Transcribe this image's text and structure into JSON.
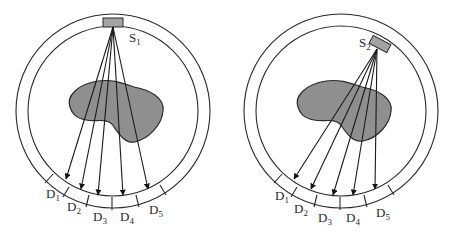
{
  "figure": {
    "colors": {
      "object_fill": "#8f8f8f",
      "source_fill": "#a3a3a3",
      "line": "#2a2a2a"
    },
    "panels": [
      {
        "id": "left",
        "source_label": {
          "main": "S",
          "sub": "1"
        },
        "detectors": [
          {
            "main": "D",
            "sub": "1"
          },
          {
            "main": "D",
            "sub": "2"
          },
          {
            "main": "D",
            "sub": "3"
          },
          {
            "main": "D",
            "sub": "4"
          },
          {
            "main": "D",
            "sub": "5"
          }
        ]
      },
      {
        "id": "right",
        "source_label": {
          "main": "S",
          "sub": "2"
        },
        "detectors": [
          {
            "main": "D",
            "sub": "1"
          },
          {
            "main": "D",
            "sub": "2"
          },
          {
            "main": "D",
            "sub": "3"
          },
          {
            "main": "D",
            "sub": "4"
          },
          {
            "main": "D",
            "sub": "5"
          }
        ]
      }
    ]
  }
}
